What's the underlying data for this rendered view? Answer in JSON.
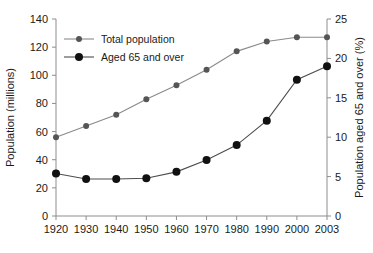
{
  "chart_data": {
    "type": "line",
    "title": "",
    "xlabel": "",
    "categories": [
      "1920",
      "1930",
      "1940",
      "1950",
      "1960",
      "1970",
      "1980",
      "1990",
      "2000",
      "2003"
    ],
    "grid": false,
    "legend_position": "top-left",
    "left_axis": {
      "label": "Population (millions)",
      "ticks": [
        "0",
        "20",
        "40",
        "60",
        "80",
        "100",
        "120",
        "140"
      ],
      "tick_values": [
        0,
        20,
        40,
        60,
        80,
        100,
        120,
        140
      ],
      "min": 0,
      "max": 140
    },
    "right_axis": {
      "label": "Population aged 65 and over (%)",
      "ticks": [
        "0",
        "5",
        "10",
        "15",
        "20",
        "25"
      ],
      "tick_values": [
        0,
        5,
        10,
        15,
        20,
        25
      ],
      "min": 0,
      "max": 25
    },
    "series": [
      {
        "name": "Total population",
        "axis": "left",
        "color": "#8a8a8a",
        "marker_color": "#555555",
        "marker_size": 3,
        "values": [
          56,
          64,
          72,
          83,
          93,
          104,
          117,
          124,
          127,
          127
        ]
      },
      {
        "name": "Aged 65 and over",
        "axis": "right",
        "color": "#4d4d4d",
        "marker_color": "#111111",
        "marker_size": 4,
        "values": [
          5.4,
          4.7,
          4.7,
          4.8,
          5.6,
          7.1,
          9.0,
          12.1,
          17.3,
          19.0
        ]
      }
    ]
  }
}
